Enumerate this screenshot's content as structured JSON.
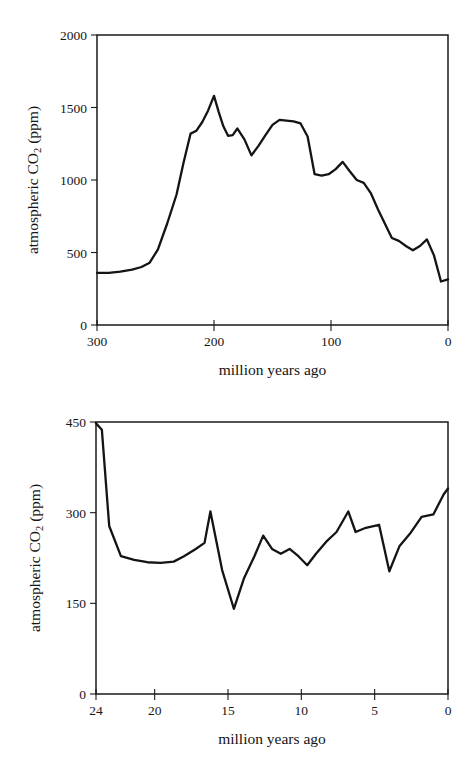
{
  "page": {
    "background_color": "#ffffff",
    "ink_color": "#141414",
    "figure_count": 2
  },
  "chart_data": [
    {
      "id": "phanerozoic-co2",
      "type": "line",
      "title": "",
      "subtitle": "",
      "xlabel": "million years ago",
      "ylabel": "atmospheric CO₂ (ppm)",
      "ylabel_parts": {
        "prefix": "atmospheric CO",
        "subscript": "2",
        "suffix": " (ppm)"
      },
      "xlim": [
        300,
        0
      ],
      "ylim": [
        0,
        2000
      ],
      "x_reversed": true,
      "grid": false,
      "legend": "none",
      "xticks": [
        300,
        200,
        100,
        0
      ],
      "xtick_labels": [
        "300",
        "200",
        "100",
        "0"
      ],
      "yticks": [
        0,
        500,
        1000,
        1500,
        2000
      ],
      "ytick_labels": [
        "0",
        "500",
        "1000",
        "1500",
        "2000"
      ],
      "series": [
        {
          "name": "atmospheric CO2",
          "color": "#141414",
          "x": [
            300,
            290,
            280,
            270,
            262,
            255,
            248,
            240,
            232,
            226,
            220,
            215,
            210,
            205,
            200,
            196,
            192,
            188,
            184,
            180,
            174,
            168,
            162,
            156,
            150,
            144,
            138,
            132,
            126,
            120,
            114,
            108,
            102,
            96,
            90,
            84,
            78,
            72,
            66,
            60,
            54,
            48,
            42,
            36,
            30,
            24,
            18,
            12,
            6,
            0
          ],
          "y": [
            360,
            360,
            368,
            382,
            400,
            430,
            520,
            700,
            900,
            1120,
            1320,
            1340,
            1400,
            1480,
            1580,
            1470,
            1370,
            1305,
            1310,
            1355,
            1280,
            1170,
            1235,
            1310,
            1380,
            1415,
            1410,
            1405,
            1390,
            1300,
            1040,
            1030,
            1040,
            1075,
            1125,
            1060,
            1000,
            980,
            910,
            800,
            700,
            600,
            580,
            545,
            515,
            545,
            590,
            480,
            300,
            315
          ]
        }
      ]
    },
    {
      "id": "neogene-co2",
      "type": "line",
      "title": "",
      "subtitle": "",
      "xlabel": "million years ago",
      "ylabel": "atmospheric CO₂ (ppm)",
      "ylabel_parts": {
        "prefix": "atmospheric CO",
        "subscript": "2",
        "suffix": " (ppm)"
      },
      "xlim": [
        24,
        0
      ],
      "ylim": [
        0,
        450
      ],
      "x_reversed": true,
      "grid": false,
      "legend": "none",
      "xticks": [
        24,
        20,
        15,
        10,
        5,
        0
      ],
      "xtick_labels": [
        "24",
        "20",
        "15",
        "10",
        "5",
        "0"
      ],
      "yticks": [
        0,
        150,
        300,
        450
      ],
      "ytick_labels": [
        "0",
        "150",
        "300",
        "450"
      ],
      "series": [
        {
          "name": "atmospheric CO2",
          "color": "#141414",
          "x": [
            24.0,
            23.6,
            23.1,
            22.3,
            21.4,
            20.5,
            19.6,
            18.7,
            18.0,
            17.2,
            16.6,
            16.2,
            15.4,
            14.6,
            13.9,
            13.2,
            12.6,
            12.0,
            11.4,
            10.8,
            10.2,
            9.6,
            9.0,
            8.3,
            7.6,
            6.8,
            6.3,
            5.6,
            4.7,
            4.0,
            3.3,
            2.6,
            1.8,
            1.0,
            0.3,
            0.0
          ],
          "y": [
            448,
            437,
            278,
            228,
            222,
            218,
            217,
            219,
            228,
            240,
            250,
            302,
            205,
            141,
            192,
            228,
            262,
            240,
            232,
            240,
            228,
            213,
            232,
            252,
            268,
            302,
            268,
            275,
            280,
            203,
            245,
            265,
            293,
            297,
            330,
            340
          ]
        }
      ]
    }
  ],
  "figures": [
    {
      "name": "top-figure",
      "xlabel": "million years ago",
      "ylabel_prefix": "atmospheric CO",
      "ylabel_sub": "2",
      "ylabel_suffix": " (ppm)"
    },
    {
      "name": "bottom-figure",
      "xlabel": "million years ago",
      "ylabel_prefix": "atmospheric CO",
      "ylabel_sub": "2",
      "ylabel_suffix": " (ppm)"
    }
  ]
}
